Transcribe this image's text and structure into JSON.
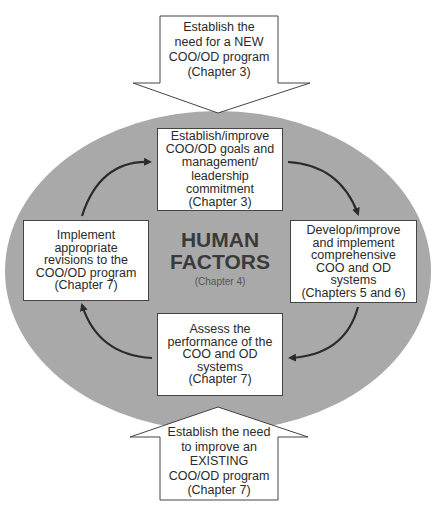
{
  "colors": {
    "ellipse_fill": "#a9a9a9",
    "box_fill": "#ffffff",
    "border": "#444444",
    "cycle_arrow": "#2b2b2b",
    "text": "#2a2a2a"
  },
  "top_arrow": {
    "direction": "down",
    "lines": [
      "Establish the",
      "need for a NEW",
      "COO/OD program",
      "(Chapter 3)"
    ]
  },
  "bottom_arrow": {
    "direction": "up",
    "lines": [
      "Establish the need",
      "to improve an",
      "EXISTING",
      "COO/OD program",
      "(Chapter 7)"
    ]
  },
  "center": {
    "title_lines": [
      "HUMAN",
      "FACTORS"
    ],
    "subtitle": "(Chapter 4)"
  },
  "cycle_boxes": {
    "top": {
      "lines": [
        "Establish/improve",
        "COO/OD goals and",
        "management/",
        "leadership",
        "commitment",
        "(Chapter 3)"
      ]
    },
    "right": {
      "lines": [
        "Develop/improve",
        "and implement",
        "comprehensive",
        "COO and OD systems",
        "(Chapters 5 and 6)"
      ]
    },
    "bottom": {
      "lines": [
        "Assess the",
        "performance of the",
        "COO and OD systems",
        "(Chapter 7)"
      ]
    },
    "left": {
      "lines": [
        "Implement",
        "appropriate",
        "revisions to the",
        "COO/OD program",
        "(Chapter 7)"
      ]
    }
  },
  "cycle_flow": [
    "top",
    "right",
    "bottom",
    "left",
    "top"
  ]
}
